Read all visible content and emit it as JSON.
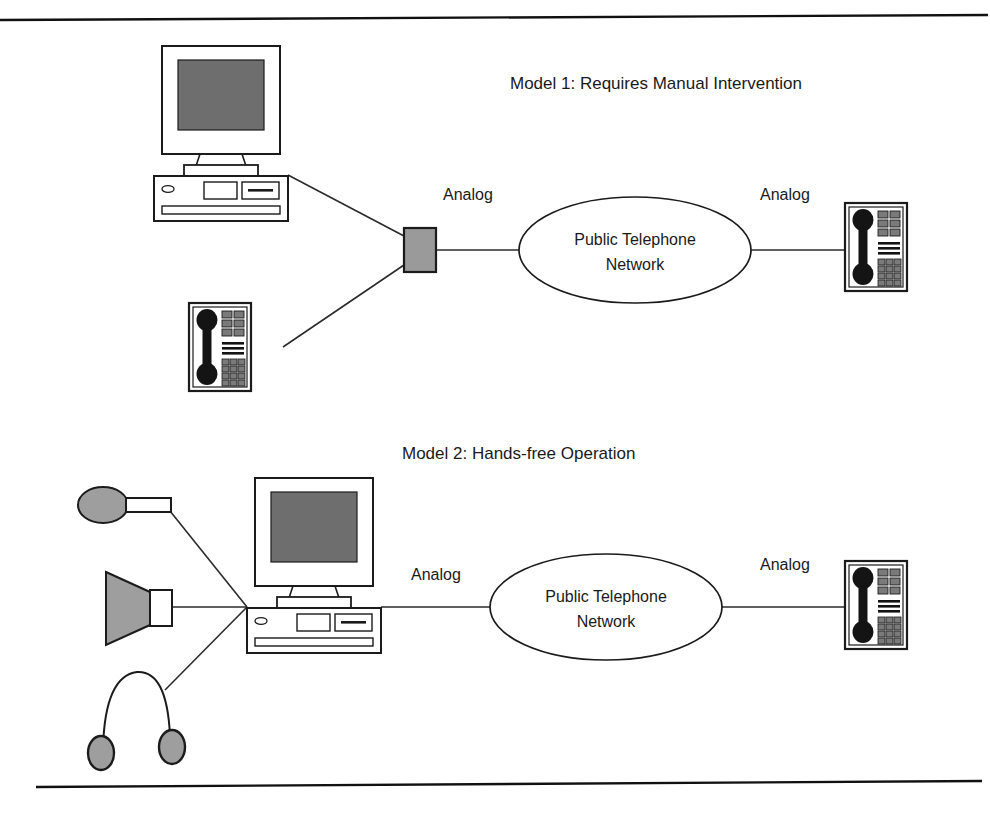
{
  "page": {
    "background_color": "#ffffff",
    "width": 990,
    "height": 813
  },
  "rules": {
    "top_rule_name": "top-horizontal-rule",
    "bottom_rule_name": "bottom-horizontal-rule"
  },
  "colors": {
    "ink": "#1b1b1b",
    "wire": "#2b2b2b",
    "screen_fill": "#6e6e6e",
    "modem_fill": "#9a9a9a",
    "device_gray": "#9e9e9e",
    "phone_black": "#141414",
    "phone_button": "#7a7a7a",
    "paper": "#ffffff"
  },
  "models": [
    {
      "id": "model-1",
      "title": "Model 1: Requires Manual Intervention",
      "nodes": [
        {
          "name": "computer",
          "label": ""
        },
        {
          "name": "telephone-local",
          "label": ""
        },
        {
          "name": "modem",
          "label": ""
        },
        {
          "name": "public-telephone-network",
          "label": "Public Telephone Network"
        },
        {
          "name": "telephone-remote",
          "label": ""
        }
      ],
      "link_labels": [
        {
          "name": "analog-label-left",
          "text": "Analog"
        },
        {
          "name": "analog-label-right",
          "text": "Analog"
        }
      ],
      "cloud_lines": [
        "Public Telephone",
        "Network"
      ]
    },
    {
      "id": "model-2",
      "title": "Model 2: Hands-free Operation",
      "nodes": [
        {
          "name": "microphone",
          "label": ""
        },
        {
          "name": "speaker",
          "label": ""
        },
        {
          "name": "headphones",
          "label": ""
        },
        {
          "name": "computer",
          "label": ""
        },
        {
          "name": "public-telephone-network",
          "label": "Public Telephone Network"
        },
        {
          "name": "telephone-remote",
          "label": ""
        }
      ],
      "link_labels": [
        {
          "name": "analog-label-left",
          "text": "Analog"
        },
        {
          "name": "analog-label-right",
          "text": "Analog"
        }
      ],
      "cloud_lines": [
        "Public Telephone",
        "Network"
      ]
    }
  ]
}
